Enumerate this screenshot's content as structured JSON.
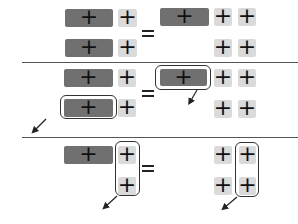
{
  "diagram": {
    "block_glyph": "+",
    "equals_glyph": "=",
    "colors": {
      "dark_block": "#707070",
      "light_block": "#dadada",
      "outline": "#333333",
      "divider": "#555555",
      "glyph": "#111111"
    },
    "panels": [
      {
        "id": "panel-1",
        "left": {
          "rows": [
            [
              "wide-dark",
              "small-light"
            ],
            [
              "wide-dark",
              "small-light"
            ]
          ]
        },
        "right": {
          "rows": [
            [
              "wide-dark",
              "small-light",
              "small-light"
            ],
            [
              "empty",
              "small-light",
              "small-light"
            ]
          ]
        },
        "highlights": []
      },
      {
        "id": "panel-2",
        "left": {
          "rows": [
            [
              "wide-dark",
              "small-light"
            ],
            [
              "wide-dark",
              "small-light"
            ]
          ]
        },
        "right": {
          "rows": [
            [
              "wide-dark",
              "small-light",
              "small-light"
            ],
            [
              "empty",
              "small-light",
              "small-light"
            ]
          ]
        },
        "highlights": [
          "left row 2 wide block",
          "right row 1 wide block"
        ]
      },
      {
        "id": "panel-3",
        "left": {
          "rows": [
            [
              "wide-dark",
              "small-light"
            ],
            [
              "empty",
              "small-light"
            ]
          ]
        },
        "right": {
          "rows": [
            [
              "small-light",
              "small-light"
            ],
            [
              "small-light",
              "small-light"
            ]
          ]
        },
        "highlights": [
          "left column 2",
          "right column 2"
        ]
      }
    ]
  }
}
